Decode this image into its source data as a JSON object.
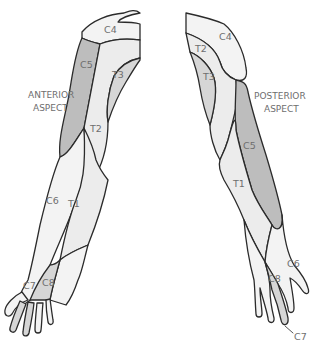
{
  "diagram": {
    "colors": {
      "light_region": "#ececec",
      "lighter_region": "#f3f3f3",
      "dark_region": "#bdbdbd",
      "mid_region": "#d6d6d6",
      "outline": "#2b2b2b",
      "label_text": "#6e6e6e"
    },
    "anterior": {
      "heading_line1": "ANTERIOR",
      "heading_line2": "ASPECT",
      "labels": {
        "c4": "C4",
        "c5": "C5",
        "t3": "T3",
        "t2": "T2",
        "c6": "C6",
        "t1": "T1",
        "c7": "C7",
        "c8": "C8"
      }
    },
    "posterior": {
      "heading_line1": "POSTERIOR",
      "heading_line2": "ASPECT",
      "labels": {
        "c4": "C4",
        "t2": "T2",
        "t3": "T3",
        "c5": "C5",
        "t1": "T1",
        "c6": "C6",
        "c8": "C8",
        "c7": "C7"
      }
    }
  }
}
